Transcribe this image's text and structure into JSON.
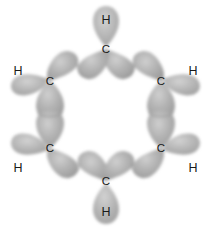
{
  "figure": {
    "background_color": "#ffffff",
    "width": 211,
    "height": 230,
    "lobe_color": "#a8a8a8",
    "lobe_edge_color": "#8f8f8f",
    "label_color": "#1a1a1a"
  },
  "atoms": [
    {
      "element": "C",
      "id": "c-top",
      "x": 106,
      "y": 49,
      "ring_index": 0
    },
    {
      "element": "C",
      "id": "c-upper-right",
      "x": 161,
      "y": 81,
      "ring_index": 1
    },
    {
      "element": "C",
      "id": "c-lower-right",
      "x": 161,
      "y": 148,
      "ring_index": 2
    },
    {
      "element": "C",
      "id": "c-bottom",
      "x": 106,
      "y": 181,
      "ring_index": 3
    },
    {
      "element": "C",
      "id": "c-lower-left",
      "x": 50,
      "y": 148,
      "ring_index": 4
    },
    {
      "element": "C",
      "id": "c-upper-left",
      "x": 50,
      "y": 81,
      "ring_index": 5
    },
    {
      "element": "H",
      "id": "h-top",
      "x": 106,
      "y": 20,
      "bonded_to": "c-top"
    },
    {
      "element": "H",
      "id": "h-upper-right",
      "x": 193,
      "y": 71,
      "bonded_to": "c-upper-right"
    },
    {
      "element": "H",
      "id": "h-lower-right",
      "x": 193,
      "y": 168,
      "bonded_to": "c-lower-right"
    },
    {
      "element": "H",
      "id": "h-bottom",
      "x": 106,
      "y": 212,
      "bonded_to": "c-bottom"
    },
    {
      "element": "H",
      "id": "h-lower-left",
      "x": 18,
      "y": 168,
      "bonded_to": "c-lower-left"
    },
    {
      "element": "H",
      "id": "h-upper-left",
      "x": 18,
      "y": 71,
      "bonded_to": "c-upper-left"
    }
  ],
  "sigma_bonds_cc": [
    {
      "id": "bond-cc-top-upper-right",
      "from": "c-top",
      "to": "c-upper-right"
    },
    {
      "id": "bond-cc-upper-right-lower-right",
      "from": "c-upper-right",
      "to": "c-lower-right"
    },
    {
      "id": "bond-cc-lower-right-bottom",
      "from": "c-lower-right",
      "to": "c-bottom"
    },
    {
      "id": "bond-cc-bottom-lower-left",
      "from": "c-bottom",
      "to": "c-lower-left"
    },
    {
      "id": "bond-cc-lower-left-upper-left",
      "from": "c-lower-left",
      "to": "c-upper-left"
    },
    {
      "id": "bond-cc-upper-left-top",
      "from": "c-upper-left",
      "to": "c-top"
    }
  ],
  "sigma_bonds_ch": [
    {
      "id": "bond-ch-top",
      "from": "c-top",
      "to": "h-top"
    },
    {
      "id": "bond-ch-upper-right",
      "from": "c-upper-right",
      "to": "h-upper-right"
    },
    {
      "id": "bond-ch-lower-right",
      "from": "c-lower-right",
      "to": "h-lower-right"
    },
    {
      "id": "bond-ch-bottom",
      "from": "c-bottom",
      "to": "h-bottom"
    },
    {
      "id": "bond-ch-lower-left",
      "from": "c-lower-left",
      "to": "h-lower-left"
    },
    {
      "id": "bond-ch-upper-left",
      "from": "c-upper-left",
      "to": "h-upper-left"
    }
  ]
}
